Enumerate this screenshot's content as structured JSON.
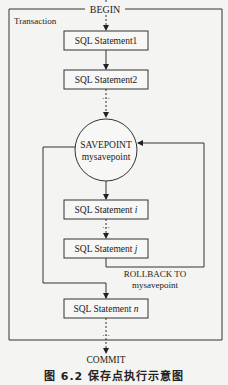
{
  "diagram": {
    "begin_label": "BEGIN",
    "frame_label": "Transaction",
    "statements": {
      "s1": "SQL Statement1",
      "s2": "SQL Statement2",
      "si_prefix": "SQL Statement ",
      "si_var": "i",
      "sj_prefix": "SQL Statement ",
      "sj_var": "j",
      "sn_prefix": "SQL Statement ",
      "sn_var": "n"
    },
    "savepoint": {
      "line1": "SAVEPOINT",
      "line2": "mysavepoint"
    },
    "rollback": {
      "line1": "ROLLBACK TO",
      "line2": "mysavepoint"
    },
    "ellipsis": "…",
    "commit_label": "COMMIT",
    "caption": "图 6.2   保存点执行示意图"
  }
}
